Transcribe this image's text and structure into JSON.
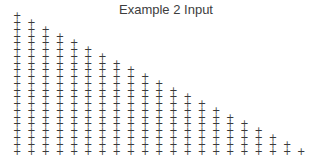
{
  "title": "Example 2 Input",
  "chart_data": {
    "type": "scatter",
    "title": "Example 2 Input",
    "marker_glyph": "+",
    "marker_color": "#3a3a3a",
    "axes": "hidden",
    "grid": "off",
    "legend": "none",
    "n_cols": 21,
    "n_rows": 21,
    "pattern": "lower-left triangle: column k has + markers in rows k through 20 (0-indexed), all columns share the same bottom row",
    "column_marker_counts": [
      21,
      20,
      19,
      18,
      17,
      16,
      15,
      14,
      13,
      12,
      11,
      10,
      9,
      8,
      7,
      6,
      5,
      4,
      3,
      2,
      1
    ],
    "total_markers": 231,
    "columns": [
      {
        "col": 0,
        "first_row": 0,
        "last_row": 20,
        "count": 21
      },
      {
        "col": 1,
        "first_row": 1,
        "last_row": 20,
        "count": 20
      },
      {
        "col": 2,
        "first_row": 2,
        "last_row": 20,
        "count": 19
      },
      {
        "col": 3,
        "first_row": 3,
        "last_row": 20,
        "count": 18
      },
      {
        "col": 4,
        "first_row": 4,
        "last_row": 20,
        "count": 17
      },
      {
        "col": 5,
        "first_row": 5,
        "last_row": 20,
        "count": 16
      },
      {
        "col": 6,
        "first_row": 6,
        "last_row": 20,
        "count": 15
      },
      {
        "col": 7,
        "first_row": 7,
        "last_row": 20,
        "count": 14
      },
      {
        "col": 8,
        "first_row": 8,
        "last_row": 20,
        "count": 13
      },
      {
        "col": 9,
        "first_row": 9,
        "last_row": 20,
        "count": 12
      },
      {
        "col": 10,
        "first_row": 10,
        "last_row": 20,
        "count": 11
      },
      {
        "col": 11,
        "first_row": 11,
        "last_row": 20,
        "count": 10
      },
      {
        "col": 12,
        "first_row": 12,
        "last_row": 20,
        "count": 9
      },
      {
        "col": 13,
        "first_row": 13,
        "last_row": 20,
        "count": 8
      },
      {
        "col": 14,
        "first_row": 14,
        "last_row": 20,
        "count": 7
      },
      {
        "col": 15,
        "first_row": 15,
        "last_row": 20,
        "count": 6
      },
      {
        "col": 16,
        "first_row": 16,
        "last_row": 20,
        "count": 5
      },
      {
        "col": 17,
        "first_row": 17,
        "last_row": 20,
        "count": 4
      },
      {
        "col": 18,
        "first_row": 18,
        "last_row": 20,
        "count": 3
      },
      {
        "col": 19,
        "first_row": 19,
        "last_row": 20,
        "count": 2
      },
      {
        "col": 20,
        "first_row": 20,
        "last_row": 20,
        "count": 1
      }
    ],
    "layout": {
      "x0": 17.3,
      "y0": 16.3,
      "dx": 14.2,
      "dy": 6.76
    }
  }
}
